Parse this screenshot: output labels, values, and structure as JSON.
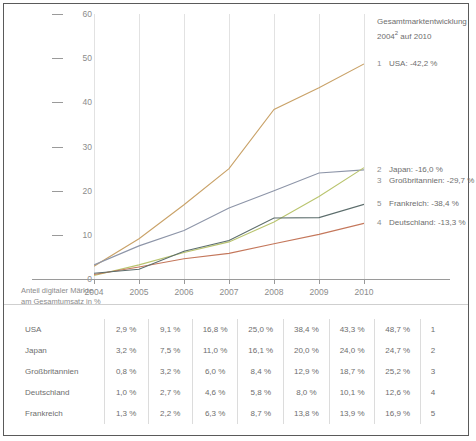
{
  "chart_data": {
    "type": "line",
    "xlabel": "",
    "ylabel": "Anteil digitaler Märkte am Gesamtumsatz in %",
    "x": [
      "2004",
      "2005",
      "2006",
      "2007",
      "2008",
      "2009",
      "2010"
    ],
    "ylim": [
      0,
      60
    ],
    "yticks": [
      0,
      10,
      20,
      30,
      40,
      50,
      60
    ],
    "grid": "vertical",
    "legend_position": "right",
    "series": [
      {
        "name": "USA",
        "rank": "1",
        "color": "#c9a268",
        "values": [
          2.9,
          9.1,
          16.8,
          25.0,
          38.4,
          43.3,
          48.7
        ]
      },
      {
        "name": "Japan",
        "rank": "2",
        "color": "#8d95a8",
        "values": [
          3.2,
          7.5,
          11.0,
          16.1,
          20.0,
          24.0,
          24.7
        ]
      },
      {
        "name": "Großbritannien",
        "rank": "3",
        "color": "#b9c46e",
        "values": [
          0.8,
          3.2,
          6.0,
          8.4,
          12.9,
          18.7,
          25.2
        ]
      },
      {
        "name": "Deutschland",
        "rank": "4",
        "color": "#c4775b",
        "values": [
          1.0,
          2.7,
          4.6,
          5.8,
          8.0,
          10.1,
          12.6
        ]
      },
      {
        "name": "Frankreich",
        "rank": "5",
        "color": "#5c6d6c",
        "values": [
          1.3,
          2.2,
          6.3,
          8.7,
          13.8,
          13.9,
          16.9
        ]
      }
    ]
  },
  "axis": {
    "y_ticks": [
      "60",
      "50",
      "40",
      "30",
      "20",
      "10",
      "0"
    ],
    "x_labels": [
      "2004",
      "2005",
      "2006",
      "2007",
      "2008",
      "2009",
      "2010"
    ],
    "caption_line1": "Anteil digitaler Märkte",
    "caption_line2": "am Gesamtumsatz in %"
  },
  "legend": {
    "title_line1": "Gesamtmarktentwicklung",
    "title_line2_pre": "2004",
    "title_line2_sup": "2",
    "title_line2_post": " auf 2010",
    "entries": [
      {
        "num": "1",
        "text": "USA: -42,2 %"
      },
      {
        "num": "2",
        "text": "Japan: -16,0 %"
      },
      {
        "num": "3",
        "text": "Großbritannien: -29,7 %"
      },
      {
        "num": "5",
        "text": "Frankreich: -38,4 %"
      },
      {
        "num": "4",
        "text": "Deutschland: -13,3 %"
      }
    ]
  },
  "end_numbers": [
    {
      "num": "1"
    },
    {
      "num": "2"
    },
    {
      "num": "3"
    },
    {
      "num": "5"
    },
    {
      "num": "4"
    }
  ],
  "table": {
    "rows": [
      {
        "name": "USA",
        "values": [
          "2,9 %",
          "9,1 %",
          "16,8 %",
          "25,0 %",
          "38,4 %",
          "43,3 %",
          "48,7 %"
        ],
        "rank": "1"
      },
      {
        "name": "Japan",
        "values": [
          "3,2 %",
          "7,5 %",
          "11,0 %",
          "16,1 %",
          "20,0 %",
          "24,0 %",
          "24,7 %"
        ],
        "rank": "2"
      },
      {
        "name": "Großbritannien",
        "values": [
          "0,8 %",
          "3,2 %",
          "6,0 %",
          "8,4 %",
          "12,9 %",
          "18,7 %",
          "25,2 %"
        ],
        "rank": "3"
      },
      {
        "name": "Deutschland",
        "values": [
          "1,0 %",
          "2,7 %",
          "4,6 %",
          "5,8 %",
          "8,0 %",
          "10,1 %",
          "12,6 %"
        ],
        "rank": "4"
      },
      {
        "name": "Frankreich",
        "values": [
          "1,3 %",
          "2,2 %",
          "6,3 %",
          "8,7 %",
          "13,8 %",
          "13,9 %",
          "16,9 %"
        ],
        "rank": "5"
      }
    ]
  }
}
